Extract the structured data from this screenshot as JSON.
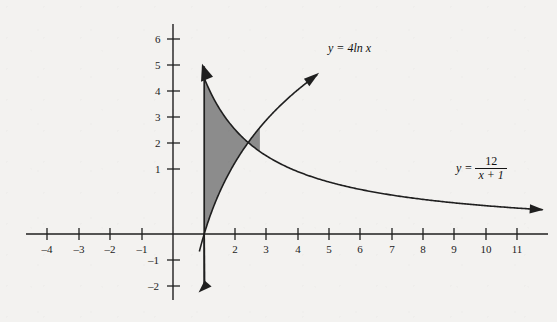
{
  "chart_data": {
    "type": "line",
    "title": "",
    "xlabel": "",
    "ylabel": "",
    "xlim": [
      -4.6,
      11.6
    ],
    "ylim": [
      -2.4,
      6.5
    ],
    "grid": false,
    "legend_position": "inline-curve-labels",
    "x_ticks": [
      "–4",
      "–3",
      "–2",
      "–1",
      "2",
      "3",
      "4",
      "5",
      "6",
      "7",
      "8",
      "9",
      "10",
      "11"
    ],
    "x_tick_values": [
      -4,
      -3,
      -2,
      -1,
      2,
      3,
      4,
      5,
      6,
      7,
      8,
      9,
      10,
      11
    ],
    "y_ticks": [
      "6",
      "5",
      "4",
      "3",
      "2",
      "1",
      "–1",
      "–2"
    ],
    "y_tick_values": [
      6,
      5,
      4,
      3,
      2,
      1,
      -1,
      -2
    ],
    "series": [
      {
        "name": "y = 4ln x",
        "label_text": "y = 4ln x",
        "formula": "y = 4*ln(x)",
        "color": "#1a1a1a",
        "arrow_end": true,
        "x_range": [
          0.79,
          4.55
        ],
        "points": [
          {
            "x": 1.0,
            "y": 0.0
          },
          {
            "x": 1.5,
            "y": 1.62
          },
          {
            "x": 2.0,
            "y": 2.77
          },
          {
            "x": 2.5,
            "y": 3.67
          },
          {
            "x": 3.0,
            "y": 4.39
          },
          {
            "x": 3.5,
            "y": 5.01
          },
          {
            "x": 4.0,
            "y": 5.55
          },
          {
            "x": 4.5,
            "y": 6.02
          }
        ]
      },
      {
        "name": "y = 12/(x+1)",
        "label_text": "y = 12 / x + 1",
        "numerator": "12",
        "denominator": "x + 1",
        "lead": "y =",
        "formula": "y = 12/(x+1)",
        "color": "#1a1a1a",
        "arrow_end": true,
        "x_range": [
          0.9,
          11.6
        ],
        "points": [
          {
            "x": 1.0,
            "y": 6.0
          },
          {
            "x": 1.5,
            "y": 4.8
          },
          {
            "x": 2.0,
            "y": 4.0
          },
          {
            "x": 3.0,
            "y": 3.0
          },
          {
            "x": 4.0,
            "y": 2.4
          },
          {
            "x": 5.0,
            "y": 2.0
          },
          {
            "x": 6.0,
            "y": 1.71
          },
          {
            "x": 7.0,
            "y": 1.5
          },
          {
            "x": 8.0,
            "y": 1.33
          },
          {
            "x": 9.0,
            "y": 1.2
          },
          {
            "x": 10.0,
            "y": 1.09
          },
          {
            "x": 11.0,
            "y": 1.0
          }
        ]
      },
      {
        "name": "vertical boundary x = 1",
        "label_text": "",
        "formula": "x = 1",
        "color": "#1a1a1a",
        "arrow_end": false,
        "points": [
          {
            "x": 1.0,
            "y": 6.45
          },
          {
            "x": 1.0,
            "y": -2.1
          }
        ]
      }
    ],
    "shaded_region": {
      "name": "region between 12/(x+1) and 4ln x for x in [1, 2.78]",
      "fill_color": "#8c8c8c",
      "fill_opacity": 1,
      "x_from": 1.0,
      "x_to": 2.78,
      "upper_curve": "y = 12/(x+1)",
      "lower_curve": "y = 4ln x",
      "intersection": {
        "x": 2.78,
        "y": 3.17
      }
    },
    "axes": {
      "x_axis_color": "#1a1a1a",
      "y_axis_color": "#1a1a1a",
      "x_axis_arrow": false,
      "y_axis_arrow": false,
      "origin_label": ""
    }
  },
  "labels": {
    "curve1": "y = 4ln x",
    "curve2_lead": "y =",
    "curve2_num": "12",
    "curve2_den": "x + 1"
  }
}
